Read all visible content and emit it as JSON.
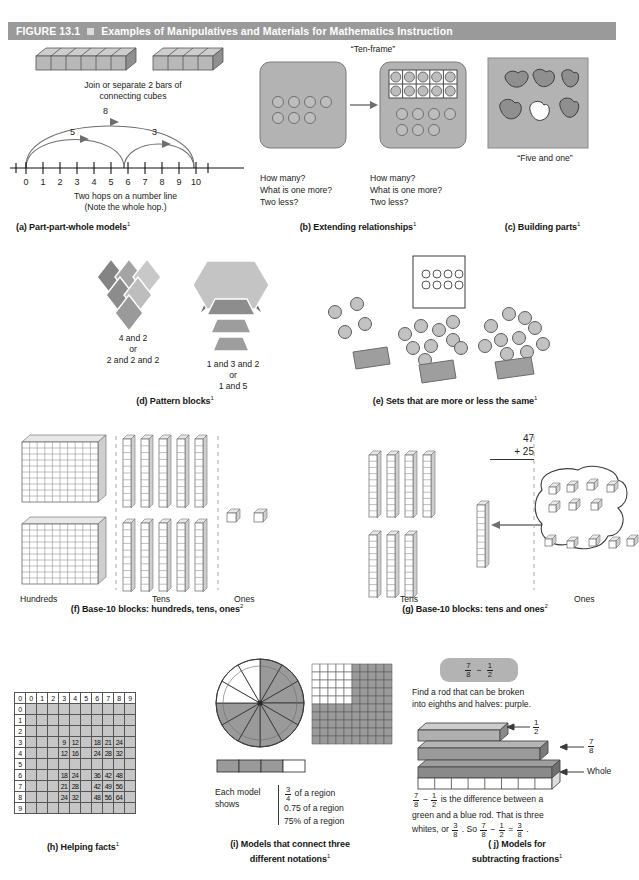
{
  "figure": {
    "number_label": "FIGURE 13.1",
    "title": "Examples of Manipulatives and Materials for Mathematics Instruction",
    "header_bg": "#9a9a9a",
    "header_text_color": "#ffffff"
  },
  "panels": {
    "a": {
      "caption": "(a) Part-part-whole models",
      "caption_sup": "1",
      "cubes_text_line1": "Join or separate 2 bars of",
      "cubes_text_line2": "connecting cubes",
      "bar1_cubes": 6,
      "bar2_cubes": 4,
      "numberline": {
        "ticks": [
          "0",
          "1",
          "2",
          "3",
          "4",
          "5",
          "6",
          "7",
          "8",
          "9",
          "10"
        ],
        "hop_whole": "8",
        "hop_left": "5",
        "hop_right": "3",
        "note_line1": "Two hops on a number line",
        "note_line2": "(Note the whole hop.)"
      }
    },
    "b": {
      "caption": "(b) Extending relationships",
      "caption_sup": "1",
      "tenframe_label": "“Ten-frame”",
      "questions": [
        "How many?",
        "What is one more?",
        "Two less?"
      ],
      "left_dots_row1": 4,
      "left_dots_row2": 3,
      "frame_dots_row1": 5,
      "frame_dots_row2": 5,
      "loose_dots_row1": 4,
      "loose_dots_row2": 3
    },
    "c": {
      "caption": "(c) Building parts",
      "caption_sup": "1",
      "label": "“Five and one”",
      "beans_total": 6,
      "beans_white": 1
    },
    "d": {
      "caption": "(d) Pattern blocks",
      "caption_sup": "1",
      "left_text": [
        "4 and 2",
        "or",
        "2 and 2 and 2"
      ],
      "right_text": [
        "1 and 3 and 2",
        "or",
        "1 and 5"
      ]
    },
    "e": {
      "caption": "(e) Sets that are more or less the same",
      "caption_sup": "1",
      "box_dots_row1": 4,
      "box_dots_row2": 4,
      "set_left_count": 4,
      "set_middle_count": 9,
      "set_right_count": 10
    },
    "f": {
      "caption": "(f) Base-10 blocks: hundreds, tens, ones",
      "caption_sup": "2",
      "column_labels": [
        "Hundreds",
        "Tens",
        "Ones"
      ],
      "hundreds_count": 2,
      "tens_count": 10,
      "ones_count": 2
    },
    "g": {
      "caption": "(g) Base-10 blocks: tens and ones",
      "caption_sup": "2",
      "column_labels": [
        "Tens",
        "Ones"
      ],
      "problem_top": "47",
      "problem_bottom": "+ 25",
      "tens_rods": 7,
      "ones_cubes": 12
    },
    "h": {
      "caption": "(h) Helping facts",
      "caption_sup": "1",
      "corner": "0",
      "col_headers": [
        "0",
        "1",
        "2",
        "3",
        "4",
        "5",
        "6",
        "7",
        "8",
        "9"
      ],
      "row_headers": [
        "0",
        "1",
        "2",
        "3",
        "4",
        "5",
        "6",
        "7",
        "8",
        "9"
      ],
      "cells": [
        [
          "",
          "",
          "",
          "",
          "",
          "",
          "",
          "",
          "",
          ""
        ],
        [
          "",
          "",
          "",
          "",
          "",
          "",
          "",
          "",
          "",
          ""
        ],
        [
          "",
          "",
          "",
          "",
          "",
          "",
          "",
          "",
          "",
          ""
        ],
        [
          "",
          "",
          "",
          "9",
          "12",
          "",
          "18",
          "21",
          "24",
          ""
        ],
        [
          "",
          "",
          "",
          "12",
          "16",
          "",
          "24",
          "28",
          "32",
          ""
        ],
        [
          "",
          "",
          "",
          "",
          "",
          "",
          "",
          "",
          "",
          ""
        ],
        [
          "",
          "",
          "",
          "18",
          "24",
          "",
          "36",
          "42",
          "48",
          ""
        ],
        [
          "",
          "",
          "",
          "21",
          "28",
          "",
          "42",
          "49",
          "56",
          ""
        ],
        [
          "",
          "",
          "",
          "24",
          "32",
          "",
          "48",
          "56",
          "64",
          ""
        ],
        [
          "",
          "",
          "",
          "",
          "",
          "",
          "",
          "",
          "",
          ""
        ]
      ]
    },
    "i": {
      "caption_line1": "(i) Models that connect three",
      "caption_line2": "different notations",
      "caption_sup": "1",
      "each_model_line1": "Each model",
      "each_model_line2": "shows",
      "notations": [
        {
          "type": "fraction",
          "numerator": "3",
          "denominator": "4",
          "suffix": " of a region"
        },
        {
          "type": "text",
          "text": "0.75 of a region"
        },
        {
          "type": "text",
          "text": "75% of a region"
        }
      ],
      "circle_slices": 12,
      "circle_shaded": 9,
      "square_cells": 100,
      "square_shaded": 75,
      "bar_parts": 4,
      "bar_shaded": 3
    },
    "j": {
      "caption_line1": "( j) Models for",
      "caption_line2": "subtracting fractions",
      "caption_sup": "1",
      "badge": {
        "a_num": "7",
        "a_den": "8",
        "op": "−",
        "b_num": "1",
        "b_den": "2"
      },
      "instruction_line1": "Find a rod that can be broken",
      "instruction_line2": "into eighths and halves: purple.",
      "rod_labels": {
        "half_num": "1",
        "half_den": "2",
        "seven_num": "7",
        "seven_den": "8",
        "whole": "Whole"
      },
      "explain": {
        "seg1_num": "7",
        "seg1_den": "8",
        "seg1_op": "−",
        "seg2_num": "1",
        "seg2_den": "2",
        "text1": " is the difference between a",
        "text2": "green and a blue rod. That is three",
        "text3a": "whites, or ",
        "r_num": "3",
        "r_den": "8",
        "text3b": ". So ",
        "e1_num": "7",
        "e1_den": "8",
        "e_op": "−",
        "e2_num": "1",
        "e2_den": "2",
        "e_eq": "=",
        "e3_num": "3",
        "e3_den": "8",
        "e_end": "."
      }
    }
  },
  "colors": {
    "gray_panel": "#b3b3b3",
    "gray_mid": "#9f9f9f",
    "gray_dark": "#7d7d7d",
    "gray_light": "#cfcfcf",
    "outline": "#4a4a4a"
  }
}
